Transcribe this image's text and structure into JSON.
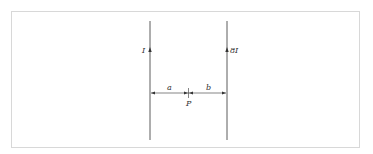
{
  "diagram": {
    "wires": [
      {
        "id": "left",
        "current_label": "I"
      },
      {
        "id": "right",
        "current_label": "8I"
      }
    ],
    "distances": {
      "a": "a",
      "b": "b"
    },
    "point_label": "P",
    "colors": {
      "line": "#333333",
      "frame": "#d8d8d8"
    }
  }
}
